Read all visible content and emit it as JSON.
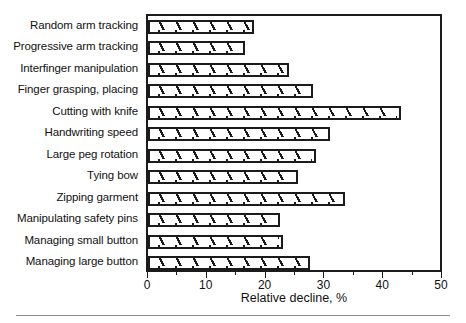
{
  "chart_data": {
    "type": "bar",
    "orientation": "horizontal",
    "title": "",
    "xlabel": "Relative decline, %",
    "ylabel": "",
    "xlim": [
      0,
      50
    ],
    "xticks": [
      0,
      10,
      20,
      30,
      40,
      50
    ],
    "xtick_labels": [
      "0",
      "10",
      "20",
      "30",
      "40",
      "50"
    ],
    "minor_xticks": [
      5,
      15,
      25,
      35,
      45
    ],
    "grid": false,
    "legend": null,
    "categories": [
      "Random arm tracking",
      "Progressive arm tracking",
      "Interfinger manipulation",
      "Finger grasping, placing",
      "Cutting with knife",
      "Handwriting speed",
      "Large peg rotation",
      "Tying bow",
      "Zipping garment",
      "Manipulating safety pins",
      "Managing small button",
      "Managing large button"
    ],
    "values": [
      18.0,
      16.5,
      24.0,
      28.0,
      43.0,
      31.0,
      28.5,
      25.5,
      33.5,
      22.5,
      23.0,
      27.5
    ],
    "bar_style": {
      "fill": "#ffffff",
      "edge": "#1b1b1b",
      "hatch": "diagonal-up-right"
    }
  }
}
